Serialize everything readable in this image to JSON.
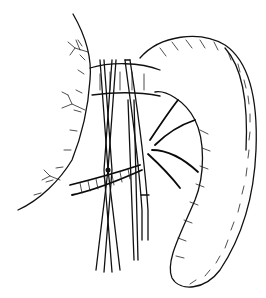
{
  "illustration": {
    "description": "Surgical line drawing: curved organ (spleen) with vessels at hilum being dissected with scissors and clamp; adjacent tissue mass on left",
    "colors": {
      "ink": "#111111",
      "background": "#ffffff"
    },
    "elements": [
      "left-tissue-mass",
      "spleen-organ",
      "hilar-vessels",
      "scissors-instrument",
      "clamp-instrument",
      "ligament-band"
    ]
  }
}
